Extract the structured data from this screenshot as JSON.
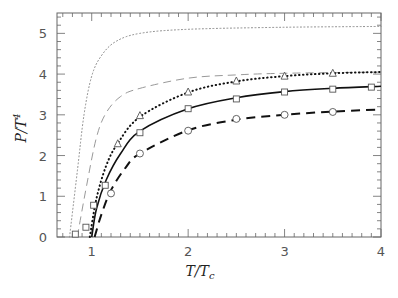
{
  "chart_data": {
    "type": "line",
    "title": "",
    "xlabel": "T/T_c",
    "ylabel": "P/T^4",
    "xlim": [
      0.64,
      4.0
    ],
    "ylim": [
      0,
      5.5
    ],
    "xticks": [
      1,
      2,
      3,
      4
    ],
    "yticks": [
      0,
      1,
      2,
      3,
      4,
      5
    ],
    "grid": false,
    "legend": null,
    "series": [
      {
        "name": "thin dotted (grey)",
        "style": "dotted-thin",
        "color": "#888888",
        "x": [
          0.77,
          0.85,
          0.92,
          1.0,
          1.1,
          1.25,
          1.5,
          2.0,
          3.0,
          4.0
        ],
        "y": [
          0.0,
          1.6,
          3.0,
          3.95,
          4.45,
          4.8,
          5.0,
          5.1,
          5.15,
          5.17
        ]
      },
      {
        "name": "thin dashed (grey)",
        "style": "dashed-thin",
        "color": "#999999",
        "x": [
          0.85,
          0.95,
          1.05,
          1.15,
          1.3,
          1.5,
          2.0,
          2.5,
          3.0,
          4.0
        ],
        "y": [
          0.0,
          1.3,
          2.45,
          3.05,
          3.45,
          3.65,
          3.9,
          3.98,
          4.02,
          4.05
        ]
      },
      {
        "name": "heavy dotted",
        "style": "dotted-thick",
        "color": "#111111",
        "x": [
          0.98,
          1.05,
          1.15,
          1.27,
          1.5,
          2.0,
          2.5,
          3.0,
          3.5,
          4.0
        ],
        "y": [
          0.0,
          0.95,
          1.75,
          2.3,
          2.95,
          3.55,
          3.82,
          3.95,
          4.02,
          4.05
        ]
      },
      {
        "name": "solid",
        "style": "solid",
        "color": "#111111",
        "x": [
          1.0,
          1.05,
          1.15,
          1.3,
          1.5,
          2.0,
          2.5,
          3.0,
          3.5,
          4.0
        ],
        "y": [
          0.0,
          0.7,
          1.4,
          2.05,
          2.6,
          3.15,
          3.42,
          3.57,
          3.65,
          3.7
        ]
      },
      {
        "name": "heavy dashed",
        "style": "dashed-thick",
        "color": "#111111",
        "x": [
          1.03,
          1.1,
          1.2,
          1.35,
          1.5,
          2.0,
          2.5,
          3.0,
          3.5,
          4.0
        ],
        "y": [
          0.0,
          0.55,
          1.15,
          1.7,
          2.05,
          2.62,
          2.88,
          3.0,
          3.08,
          3.13
        ]
      }
    ],
    "markers": [
      {
        "name": "triangles",
        "shape": "triangle",
        "x": [
          1.27,
          1.5,
          2.0,
          2.5,
          3.0,
          3.5
        ],
        "y": [
          2.29,
          2.98,
          3.56,
          3.83,
          3.95,
          4.02
        ]
      },
      {
        "name": "squares",
        "shape": "square",
        "x": [
          0.83,
          0.94,
          1.02,
          1.14,
          1.5,
          2.0,
          2.5,
          3.0,
          3.5,
          3.9
        ],
        "y": [
          0.07,
          0.24,
          0.78,
          1.27,
          2.56,
          3.15,
          3.39,
          3.56,
          3.63,
          3.68
        ]
      },
      {
        "name": "circles",
        "shape": "circle",
        "x": [
          1.2,
          1.5,
          2.0,
          2.5,
          3.0,
          3.5
        ],
        "y": [
          1.07,
          2.05,
          2.61,
          2.9,
          3.0,
          3.07
        ]
      }
    ]
  },
  "labels": {
    "xlabel_main": "T/T",
    "xlabel_sub": "c",
    "ylabel_main": "P/T",
    "ylabel_sup": "4"
  }
}
